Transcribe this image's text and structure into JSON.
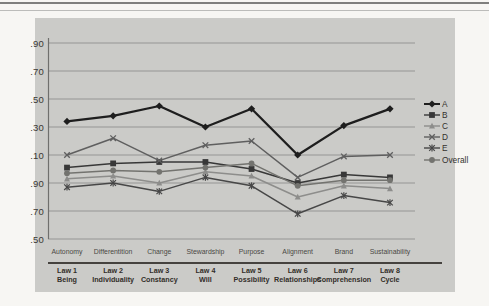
{
  "chart_data": {
    "type": "line",
    "categories": [
      "Autonomy",
      "Differentition",
      "Change",
      "Stewardship",
      "Purpose",
      "Alignment",
      "Brand",
      "Sustainability"
    ],
    "category_sublabels": [
      [
        "Law 1",
        "Being"
      ],
      [
        "Law 2",
        "Individuality"
      ],
      [
        "Law 3",
        "Constancy"
      ],
      [
        "Law 4",
        "Will"
      ],
      [
        "Law 5",
        "Possibility"
      ],
      [
        "Law 6",
        "Relationships"
      ],
      [
        "Law 7",
        "Comprehension"
      ],
      [
        "Law 8",
        "Cycle"
      ]
    ],
    "y_axis": {
      "tick_labels_top_to_bottom": [
        ".90",
        ".70",
        ".50",
        ".30",
        ".10",
        ".90",
        ".70",
        ".50"
      ],
      "ylim": [
        4.5,
        5.9
      ],
      "tick_step": 0.2,
      "note": "tick labels show decimal part only; scale wraps from 4.50 at bottom to 5.90 at top",
      "grid": "on"
    },
    "series": [
      {
        "name": "A",
        "marker": "diamond",
        "color": "#1e1e1e",
        "width": 2.3,
        "values": [
          5.34,
          5.38,
          5.45,
          5.3,
          5.43,
          5.1,
          5.31,
          5.43
        ]
      },
      {
        "name": "B",
        "marker": "square",
        "color": "#383838",
        "width": 1.5,
        "values": [
          5.01,
          5.04,
          5.05,
          5.05,
          5.0,
          4.9,
          4.96,
          4.94
        ]
      },
      {
        "name": "C",
        "marker": "triangle",
        "color": "#8d8d8b",
        "width": 1.5,
        "values": [
          4.93,
          4.95,
          4.9,
          4.98,
          4.95,
          4.8,
          4.88,
          4.86
        ]
      },
      {
        "name": "D",
        "marker": "x",
        "color": "#5f5f5f",
        "width": 1.5,
        "values": [
          5.1,
          5.22,
          5.06,
          5.17,
          5.2,
          4.94,
          5.09,
          5.1
        ]
      },
      {
        "name": "E",
        "marker": "asterisk",
        "color": "#474747",
        "width": 1.5,
        "values": [
          4.87,
          4.9,
          4.84,
          4.94,
          4.88,
          4.68,
          4.81,
          4.76
        ]
      },
      {
        "name": "Overall",
        "marker": "circle",
        "color": "#73736f",
        "width": 1.5,
        "values": [
          4.97,
          4.99,
          4.98,
          5.01,
          5.04,
          4.88,
          4.92,
          4.92
        ]
      }
    ],
    "legend": {
      "position": "right",
      "entries": [
        "A",
        "B",
        "C",
        "D",
        "E",
        "Overall"
      ]
    }
  },
  "colors": {
    "page_bg": "#f7f6f3",
    "panel_bg": "#cbcbc8",
    "grid": "#90908e",
    "axis": "#6f6f6d",
    "tick_text": "#3a3834",
    "category_text": "#4a4844",
    "law_text": "#322e29"
  }
}
